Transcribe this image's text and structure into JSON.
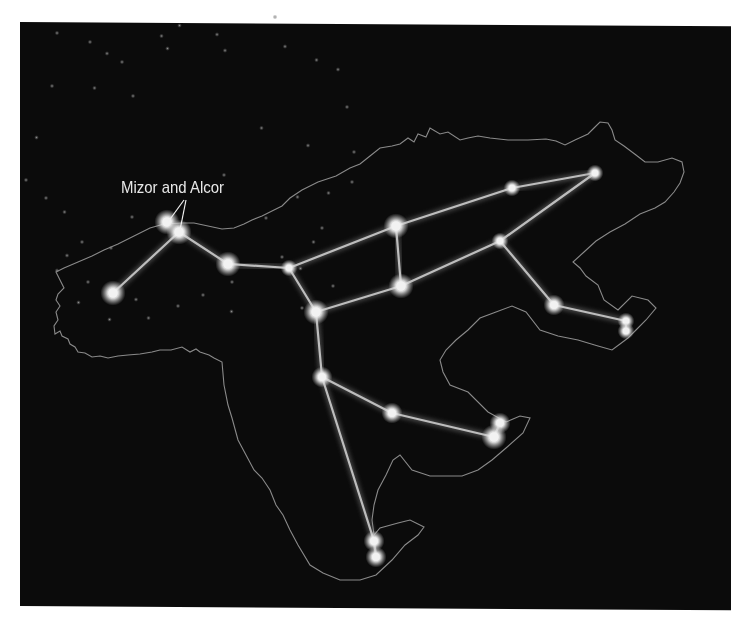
{
  "diagram": {
    "background_color": "#0b0b0b",
    "outline_color": "#8a8a8a",
    "line_color": "#bdbdbd",
    "star_color": "#f2f2f2",
    "annotation": {
      "text": "Mizor and Alcor",
      "x": 121,
      "y": 178,
      "pointer_lines": [
        {
          "from": [
            184,
            200
          ],
          "to": [
            168,
            222
          ]
        },
        {
          "from": [
            186,
            200
          ],
          "to": [
            180,
            230
          ]
        }
      ]
    },
    "stars": [
      {
        "id": "tail-end",
        "x": 113,
        "y": 293,
        "r": 6
      },
      {
        "id": "mizar",
        "x": 167,
        "y": 222,
        "r": 6
      },
      {
        "id": "alcor",
        "x": 179,
        "y": 232,
        "r": 6
      },
      {
        "id": "alioth",
        "x": 228,
        "y": 264,
        "r": 6
      },
      {
        "id": "megrez",
        "x": 289,
        "y": 268,
        "r": 4
      },
      {
        "id": "upper-body",
        "x": 396,
        "y": 226,
        "r": 6
      },
      {
        "id": "lower-body",
        "x": 401,
        "y": 286,
        "r": 6
      },
      {
        "id": "phecda",
        "x": 316,
        "y": 312,
        "r": 6
      },
      {
        "id": "neck",
        "x": 512,
        "y": 188,
        "r": 4
      },
      {
        "id": "nose",
        "x": 595,
        "y": 173,
        "r": 4
      },
      {
        "id": "shoulder",
        "x": 500,
        "y": 241,
        "r": 4
      },
      {
        "id": "front-knee",
        "x": 554,
        "y": 305,
        "r": 5
      },
      {
        "id": "front-paw-1",
        "x": 626,
        "y": 321,
        "r": 4
      },
      {
        "id": "front-paw-2",
        "x": 626,
        "y": 331,
        "r": 4
      },
      {
        "id": "hip",
        "x": 322,
        "y": 377,
        "r": 5
      },
      {
        "id": "hind-knee",
        "x": 392,
        "y": 413,
        "r": 5
      },
      {
        "id": "hind-paw-1",
        "x": 500,
        "y": 423,
        "r": 5
      },
      {
        "id": "hind-paw-2",
        "x": 494,
        "y": 437,
        "r": 6
      },
      {
        "id": "back-paw-1",
        "x": 374,
        "y": 541,
        "r": 5
      },
      {
        "id": "back-paw-2",
        "x": 376,
        "y": 557,
        "r": 5
      }
    ],
    "lines": [
      [
        "tail-end",
        "alcor"
      ],
      [
        "alcor",
        "alioth"
      ],
      [
        "alioth",
        "megrez"
      ],
      [
        "megrez",
        "upper-body"
      ],
      [
        "upper-body",
        "neck"
      ],
      [
        "neck",
        "nose"
      ],
      [
        "nose",
        "shoulder"
      ],
      [
        "shoulder",
        "lower-body"
      ],
      [
        "upper-body",
        "lower-body"
      ],
      [
        "megrez",
        "phecda"
      ],
      [
        "phecda",
        "lower-body"
      ],
      [
        "shoulder",
        "front-knee"
      ],
      [
        "front-knee",
        "front-paw-1"
      ],
      [
        "front-paw-1",
        "front-paw-2"
      ],
      [
        "phecda",
        "hip"
      ],
      [
        "hip",
        "hind-knee"
      ],
      [
        "hind-knee",
        "hind-paw-2"
      ],
      [
        "hind-paw-2",
        "hind-paw-1"
      ],
      [
        "hip",
        "back-paw-1"
      ],
      [
        "back-paw-1",
        "back-paw-2"
      ]
    ],
    "background_stars": [
      [
        355,
        47
      ],
      [
        546,
        30
      ],
      [
        110,
        62
      ],
      [
        176,
        80
      ],
      [
        319,
        68
      ],
      [
        430,
        65
      ],
      [
        566,
        89
      ],
      [
        210,
        103
      ],
      [
        240,
        120
      ],
      [
        331,
        93
      ],
      [
        446,
        97
      ],
      [
        629,
        116
      ],
      [
        672,
        135
      ],
      [
        100,
        168
      ],
      [
        185,
        172
      ],
      [
        262,
        188
      ],
      [
        69,
        271
      ],
      [
        48,
        356
      ],
      [
        88,
        392
      ],
      [
        125,
        420
      ],
      [
        260,
        430
      ],
      [
        160,
        480
      ],
      [
        218,
        492
      ],
      [
        130,
        507
      ],
      [
        110,
        537
      ],
      [
        172,
        560
      ],
      [
        268,
        595
      ],
      [
        215,
        635
      ],
      [
        460,
        560
      ],
      [
        560,
        510
      ],
      [
        597,
        533
      ],
      [
        623,
        480
      ],
      [
        640,
        452
      ],
      [
        700,
        360
      ],
      [
        653,
        382
      ],
      [
        591,
        390
      ],
      [
        612,
        287
      ],
      [
        704,
        300
      ],
      [
        690,
        210
      ],
      [
        519,
        252
      ],
      [
        444,
        346
      ],
      [
        528,
        432
      ],
      [
        662,
        568
      ],
      [
        600,
        612
      ],
      [
        459,
        619
      ],
      [
        402,
        586
      ],
      [
        153,
        601
      ],
      [
        293,
        632
      ],
      [
        352,
        608
      ]
    ]
  }
}
